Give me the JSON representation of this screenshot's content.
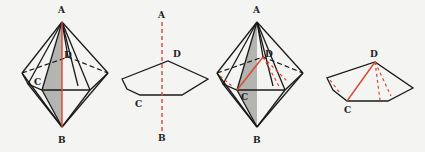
{
  "figures": [
    {
      "id": "fig1",
      "description": "Hexagonal bipyramid with shaded cross-section through A, B, C and red axis AB",
      "labels": {
        "A": "A",
        "B": "B",
        "C": "C",
        "D": "D"
      }
    },
    {
      "id": "fig2",
      "description": "Hexagonal base cross-section with dashed red axis AB",
      "labels": {
        "A": "A",
        "B": "B",
        "C": "C",
        "D": "D"
      }
    },
    {
      "id": "fig3",
      "description": "Hexagonal bipyramid with shaded cross-section and red segment DC",
      "labels": {
        "A": "A",
        "B": "B",
        "C": "C",
        "D": "D"
      }
    },
    {
      "id": "fig4",
      "description": "Hexagonal base with red segment DC and dashed red segments from D",
      "labels": {
        "C": "C",
        "D": "D"
      }
    }
  ],
  "colors": {
    "line": "#1a1a1a",
    "accent_red": "#d9472f",
    "shade": "#a8a8a4",
    "background": "#f4f4f2"
  }
}
